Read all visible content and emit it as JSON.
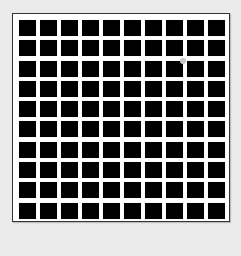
{
  "figure": {
    "type": "hermann-grid",
    "rows": 10,
    "columns": 10,
    "cell_color": "#000000",
    "line_color": "#ffffff",
    "background_color": "#ebebeb",
    "border_color": "#333333",
    "highlight_dot": {
      "color": "#c8c8c8",
      "x": 183,
      "y": 61
    }
  }
}
